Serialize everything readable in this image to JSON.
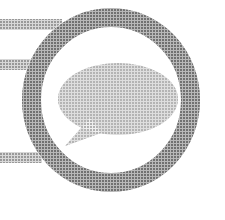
{
  "image": {
    "kind": "logo-mark",
    "title": "Speech bubble ring logo",
    "background_color": "#ffffff",
    "rendering": "halftone-dithered-grayscale-scan",
    "width": 225,
    "height": 220
  },
  "palette": {
    "ring_gray": "#7e7e7e",
    "ring_gray_light": "#8d8d8d",
    "bubble_gray": "#b2b2b2",
    "bubble_gray_light": "#bdbdbd",
    "bar_gray": "#9a9a9a",
    "bar_gray_light": "#a8a8a8",
    "white": "#ffffff"
  },
  "shapes": {
    "ring": {
      "name": "outer-ring",
      "center_x": 111,
      "center_y": 100,
      "outer_radius_x": 89,
      "outer_radius_y": 92,
      "stroke_width": 19,
      "color": "#7e7e7e"
    },
    "bubble": {
      "name": "speech-bubble",
      "center_x": 118,
      "center_y": 99,
      "radius_x": 60,
      "radius_y": 36,
      "color": "#b2b2b2",
      "tail": {
        "tip_x": 65,
        "tip_y": 146,
        "base_top_x": 90,
        "base_top_y": 118,
        "base_bottom_x": 101,
        "base_bottom_y": 133
      }
    },
    "bars": [
      {
        "name": "bar-top",
        "x": 0,
        "y": 19,
        "width": 60,
        "height": 11,
        "color": "#9a9a9a"
      },
      {
        "name": "bar-middle",
        "x": 0,
        "y": 59,
        "width": 38,
        "height": 11,
        "color": "#9a9a9a"
      },
      {
        "name": "bar-bottom",
        "x": 0,
        "y": 152,
        "width": 40,
        "height": 11,
        "color": "#9a9a9a"
      }
    ]
  },
  "labels": {
    "alt_text": "Grey ring with a speech bubble inside and three horizontal bars to the left"
  }
}
